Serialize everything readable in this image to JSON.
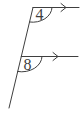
{
  "diagram": {
    "type": "geometry-parallel-lines-transversal",
    "angles": [
      {
        "position": "top",
        "label": "4"
      },
      {
        "position": "bottom",
        "label": "8"
      }
    ],
    "parallel_marks": "right-arrow chevrons on both horizontal rays",
    "colors": {
      "line": "#3f3f3f",
      "background": "#ffffff"
    }
  }
}
